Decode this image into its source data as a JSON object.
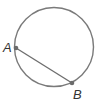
{
  "diagram": {
    "type": "circle-with-chord",
    "circle": {
      "cx": 54,
      "cy": 47,
      "r": 39.5,
      "stroke": "#7a7a7a"
    },
    "chord": {
      "from": "A",
      "to": "B",
      "stroke": "#6e6e6e"
    },
    "points": [
      {
        "name": "A",
        "x": 16,
        "y": 48,
        "label": "A",
        "label_x": 3,
        "label_y": 52
      },
      {
        "name": "B",
        "x": 72,
        "y": 83,
        "label": "B",
        "label_x": 73,
        "label_y": 99
      }
    ],
    "point_color": "#6b6b6b",
    "label_color": "#333333"
  }
}
